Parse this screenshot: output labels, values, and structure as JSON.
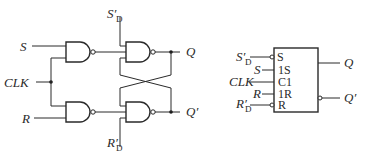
{
  "left_circuit": {
    "title": "Clocked SR flip-flop (gate-level)",
    "inputs": {
      "s": "S",
      "clk": "CLK",
      "r": "R",
      "sd_main": "S",
      "sd_prime": "′",
      "sd_sub": "D",
      "rd_main": "R",
      "rd_prime": "′",
      "rd_sub": "D"
    },
    "outputs": {
      "q": "Q",
      "q_prime": "Q′"
    },
    "gates": [
      "G1 NAND (S, CLK)",
      "G2 NAND (R, CLK)",
      "G3 NAND (G1, S'D, Q')",
      "G4 NAND (G2, R'D, Q)"
    ]
  },
  "right_symbol": {
    "title": "Logic symbol",
    "pins_left": [
      {
        "ext_main": "S",
        "ext_prime": "′",
        "ext_sub": "D",
        "inner": "S",
        "inverted": true
      },
      {
        "ext_main": "S",
        "ext_prime": "",
        "ext_sub": "",
        "inner": "1S",
        "inverted": false
      },
      {
        "ext_main": "CLK",
        "ext_prime": "",
        "ext_sub": "",
        "inner": "C1",
        "inverted": false
      },
      {
        "ext_main": "R",
        "ext_prime": "",
        "ext_sub": "",
        "inner": "1R",
        "inverted": false
      },
      {
        "ext_main": "R",
        "ext_prime": "′",
        "ext_sub": "D",
        "inner": "R",
        "inverted": true
      }
    ],
    "outputs": {
      "q": "Q",
      "q_prime": "Q′"
    }
  },
  "colors": {
    "line": "#2a2a2a",
    "background": "#ffffff"
  }
}
